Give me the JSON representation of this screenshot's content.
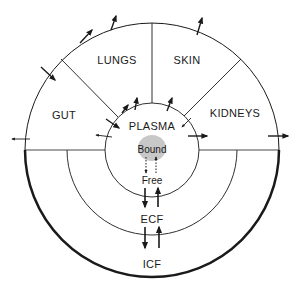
{
  "diagram": {
    "compartments": {
      "lungs": "LUNGS",
      "skin": "SKIN",
      "gut": "GUT",
      "kidneys": "KIDNEYS",
      "plasma": "PLASMA",
      "bound": "Bound",
      "free": "Free",
      "ecf": "ECF",
      "icf": "ICF"
    },
    "colors": {
      "line": "#1a1a1a",
      "bound_fill": "#c8c8c8",
      "background": "#ffffff"
    }
  }
}
